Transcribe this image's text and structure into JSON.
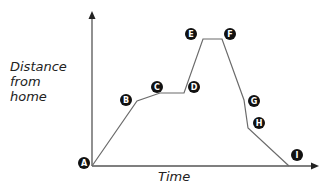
{
  "chart_data": {
    "type": "line",
    "title": "",
    "xlabel": "Time",
    "ylabel": "Distance from home",
    "ylabel_lines": [
      "Distance",
      "from",
      "home"
    ],
    "grid": false,
    "points": [
      {
        "label": "A",
        "x": 0,
        "y": 0
      },
      {
        "label": "B",
        "x": 45,
        "y": 65
      },
      {
        "label": "C",
        "x": 68,
        "y": 73
      },
      {
        "label": "D",
        "x": 92,
        "y": 73
      },
      {
        "label": "E",
        "x": 111,
        "y": 127
      },
      {
        "label": "F",
        "x": 130,
        "y": 127
      },
      {
        "label": "G",
        "x": 152,
        "y": 66
      },
      {
        "label": "H",
        "x": 156,
        "y": 38
      },
      {
        "label": "I",
        "x": 197,
        "y": 0
      }
    ],
    "markers": {
      "A": {
        "x": 84,
        "y": 163
      },
      "B": {
        "x": 126,
        "y": 100
      },
      "C": {
        "x": 157,
        "y": 87
      },
      "D": {
        "x": 194,
        "y": 87
      },
      "E": {
        "x": 191,
        "y": 34
      },
      "F": {
        "x": 230,
        "y": 34
      },
      "G": {
        "x": 254,
        "y": 101
      },
      "H": {
        "x": 259,
        "y": 123
      },
      "I": {
        "x": 297,
        "y": 155
      }
    },
    "colors": {
      "line": "#6b6b6b",
      "axis": "#555555",
      "marker_fill": "#111111",
      "marker_text": "#ffffff"
    }
  }
}
